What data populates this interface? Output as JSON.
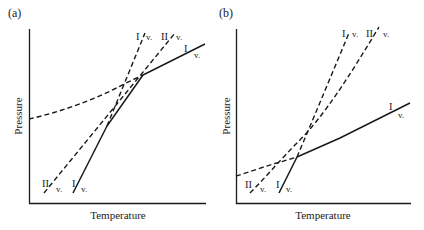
{
  "figure": {
    "panels": [
      {
        "id": "a",
        "label": "(a)",
        "xlabel": "Temperature",
        "ylabel": "Pressure",
        "curves": [
          {
            "name": "I-v-solid-steep",
            "phase_boundary": "I/v",
            "style": "solid",
            "label_top": "I",
            "label_bot": "v."
          },
          {
            "name": "II-v-dashed-steep",
            "phase_boundary": "II/v",
            "style": "dashed",
            "label_top": "II",
            "label_bot": "v."
          },
          {
            "name": "I-v-dashed-upper",
            "phase_boundary": "I/v",
            "style": "dashed",
            "label_top": "I",
            "label_bot": "v."
          },
          {
            "name": "II-v-dashed-upper",
            "phase_boundary": "II/v",
            "style": "dashed",
            "label_top": "II",
            "label_bot": "v."
          },
          {
            "name": "I-v-shallow",
            "phase_boundary": "I/v",
            "style": "dashed-then-solid",
            "label_top": "I",
            "label_bot": "v."
          }
        ]
      },
      {
        "id": "b",
        "label": "(b)",
        "xlabel": "Temperature",
        "ylabel": "Pressure",
        "curves": [
          {
            "name": "I-v-solid-steep",
            "phase_boundary": "I/v",
            "style": "solid",
            "label_top": "I",
            "label_bot": "v."
          },
          {
            "name": "II-v-dashed-steep",
            "phase_boundary": "II/v",
            "style": "dashed",
            "label_top": "II",
            "label_bot": "v."
          },
          {
            "name": "I-v-dashed-upper",
            "phase_boundary": "I/v",
            "style": "dashed",
            "label_top": "I",
            "label_bot": "v."
          },
          {
            "name": "II-v-dashed-upper",
            "phase_boundary": "II/v",
            "style": "dashed",
            "label_top": "II",
            "label_bot": "v."
          },
          {
            "name": "I-v-shallow",
            "phase_boundary": "I/v",
            "style": "dashed-then-solid",
            "label_top": "I",
            "label_bot": "v."
          }
        ]
      }
    ]
  }
}
